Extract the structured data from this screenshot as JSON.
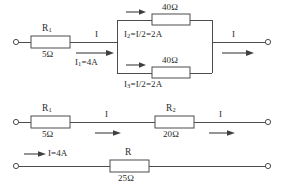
{
  "diagram": {
    "line_color": "#4c4c4c",
    "text_color": "#2b2b2b",
    "background": "#ffffff",
    "rows": [
      {
        "id": "row-1",
        "name": "original-network",
        "elements": {
          "r1_label": "R",
          "r1_sub": "1",
          "r1_value": "5Ω",
          "branch_top_value": "40Ω",
          "branch_bottom_value": "40Ω",
          "current_in": "I",
          "current_in_value": "I",
          "current_in_sub": "1",
          "current_in_eq": "=4A",
          "branch_top_current": "I",
          "branch_top_current_sub": "2",
          "branch_top_current_eq": "=I/2=2A",
          "branch_bottom_current": "I",
          "branch_bottom_current_sub": "3",
          "branch_bottom_current_eq": "=I/2=2A",
          "current_out": "I"
        }
      },
      {
        "id": "row-2",
        "name": "series-reduced-network",
        "elements": {
          "r1_label": "R",
          "r1_sub": "1",
          "r1_value": "5Ω",
          "r2_label": "R",
          "r2_sub": "2",
          "r2_value": "20Ω",
          "current_mid": "I",
          "current_out": "I"
        }
      },
      {
        "id": "row-3",
        "name": "fully-reduced-network",
        "elements": {
          "r_label": "R",
          "r_value": "25Ω",
          "current_in": "I=4A"
        }
      }
    ]
  }
}
